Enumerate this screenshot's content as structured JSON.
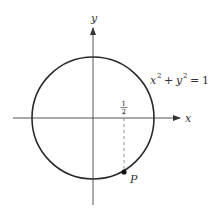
{
  "diagram": {
    "type": "unit-circle",
    "axes": {
      "x_label": "x",
      "y_label": "y"
    },
    "equation": {
      "base_x": "x",
      "exp_x": "2",
      "plus": "+",
      "base_y": "y",
      "exp_y": "2",
      "equals": "=",
      "rhs": "1"
    },
    "tick": {
      "numerator": "1",
      "denominator": "2",
      "x_value": 0.5
    },
    "point": {
      "label": "P",
      "x": 0.5,
      "y": -0.866
    },
    "colors": {
      "stroke": "#2a2a2a",
      "axis": "#555555",
      "dashed": "#777777"
    }
  }
}
